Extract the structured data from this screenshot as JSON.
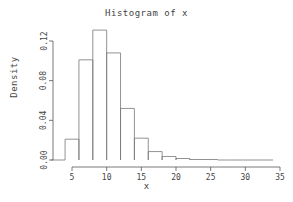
{
  "chart_data": {
    "type": "bar",
    "title": "Histogram of x",
    "xlabel": "x",
    "ylabel": "Density",
    "grid": false,
    "legend": null,
    "xlim": [
      3,
      34
    ],
    "ylim": [
      0,
      0.132
    ],
    "xticks": [
      5,
      10,
      15,
      20,
      25,
      30,
      35
    ],
    "xtick_labels": [
      "5",
      "10",
      "15",
      "20",
      "25",
      "30",
      "35"
    ],
    "yticks": [
      0.0,
      0.04,
      0.08,
      0.12
    ],
    "ytick_labels": [
      "0.00",
      "0.04",
      "0.08",
      "0.12"
    ],
    "bin_width": 2,
    "bin_edges": [
      2,
      4,
      6,
      8,
      10,
      12,
      14,
      16,
      18,
      20,
      22,
      24,
      26,
      28,
      30,
      32,
      34
    ],
    "categories": [
      "2-4",
      "4-6",
      "6-8",
      "8-10",
      "10-12",
      "12-14",
      "14-16",
      "16-18",
      "18-20",
      "20-22",
      "22-24",
      "24-26",
      "26-28",
      "28-30",
      "30-32",
      "32-34"
    ],
    "values": [
      0.0,
      0.021,
      0.101,
      0.131,
      0.108,
      0.052,
      0.022,
      0.0085,
      0.0035,
      0.0015,
      0.0005,
      0.0005,
      0.0,
      0.0,
      0.0,
      0.0
    ],
    "colors": {
      "bar_stroke": "#777777",
      "axis": "#555555",
      "text": "#444444",
      "background": "#ffffff"
    }
  }
}
